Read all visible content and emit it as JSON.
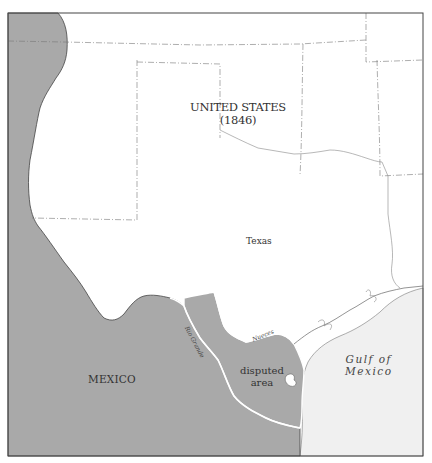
{
  "map": {
    "title": "UNITED STATES (1846)",
    "labels": {
      "us_line1": "UNITED STATES",
      "us_line2": "(1846)",
      "texas": "Texas",
      "mexico": "MEXICO",
      "disputed_line1": "disputed",
      "disputed_line2": "area",
      "gulf_line1": "Gulf of",
      "gulf_line2": "Mexico",
      "river_rio_grande": "Rio Grande",
      "river_nueces": "Nueces"
    },
    "colors": {
      "mexico_fill": "#a9a9a9",
      "disputed_fill": "#a9a9a9",
      "us_fill": "#ffffff",
      "gulf_fill": "#f0f0f0",
      "border": "#555555",
      "river": "#ffffff"
    }
  }
}
